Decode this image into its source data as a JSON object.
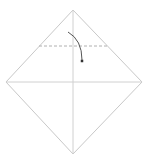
{
  "diagram": {
    "type": "origami-fold-step",
    "background": "#ffffff",
    "paper": {
      "shape": "square-rotated-45",
      "vertices": {
        "top": [
          73,
          10
        ],
        "right": [
          142,
          82
        ],
        "bottom": [
          73,
          154
        ],
        "left": [
          6,
          82
        ]
      },
      "edge_color": "#c8c8c8"
    },
    "creases": [
      {
        "name": "horizontal-diagonal",
        "from": [
          6,
          82
        ],
        "to": [
          142,
          82
        ],
        "color": "#d0d0d0"
      },
      {
        "name": "vertical-diagonal",
        "from": [
          73,
          10
        ],
        "to": [
          73,
          154
        ],
        "color": "#d0d0d0"
      }
    ],
    "valley_fold_line": {
      "from": [
        39,
        46
      ],
      "to": [
        108,
        46
      ],
      "style": "dashed",
      "color": "#b0b0b0"
    },
    "fold_arrow": {
      "path": "M68 32 Q 82 40 82 60",
      "color": "#555555",
      "head": [
        82,
        61
      ]
    }
  }
}
